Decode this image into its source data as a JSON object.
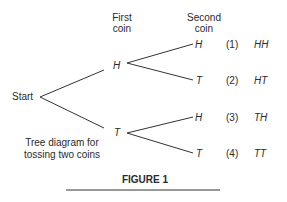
{
  "headers": {
    "first_coin_line1": "First",
    "first_coin_line2": "coin",
    "second_coin_line1": "Second",
    "second_coin_line2": "coin"
  },
  "tree": {
    "root": "Start",
    "first_level": [
      "H",
      "T"
    ],
    "second_level": [
      "H",
      "T",
      "H",
      "T"
    ]
  },
  "outcomes": [
    {
      "index": "(1)",
      "result": "HH"
    },
    {
      "index": "(2)",
      "result": "HT"
    },
    {
      "index": "(3)",
      "result": "TH"
    },
    {
      "index": "(4)",
      "result": "TT"
    }
  ],
  "caption": {
    "line1": "Tree diagram for",
    "line2": "tossing two coins"
  },
  "figure_label": "FIGURE 1",
  "colors": {
    "ink": "#2a2a2a",
    "line": "#333333"
  }
}
